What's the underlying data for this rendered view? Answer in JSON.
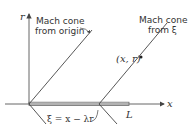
{
  "diagram": {
    "axes": {
      "vertical_label": "r",
      "horizontal_label": "x"
    },
    "labels": {
      "mach_cone_origin_line1": "Mach cone",
      "mach_cone_origin_line2": "from origin",
      "mach_cone_xi_line1": "Mach cone",
      "mach_cone_xi_line2": "from ξ",
      "point": "(x, r)",
      "xi_equation": "ξ = x − λr",
      "length": "L"
    },
    "colors": {
      "line": "#444444",
      "text": "#333333",
      "background": "#ffffff"
    }
  }
}
